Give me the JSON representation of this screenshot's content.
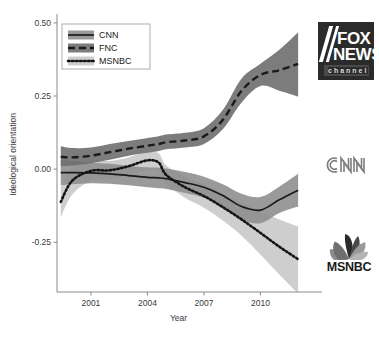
{
  "chart_data": {
    "type": "line",
    "title": "",
    "xlabel": "Year",
    "ylabel": "Ideological orientation",
    "xlim": [
      1999.2,
      2012.1
    ],
    "ylim": [
      -0.42,
      0.52
    ],
    "xticks": [
      2001,
      2004,
      2007,
      2010
    ],
    "xticklabels": [
      "2001",
      "2004",
      "2007",
      "2010"
    ],
    "yticks": [
      0.5,
      0.25,
      0.0,
      -0.25
    ],
    "yticklabels": [
      "0.50",
      "0.25",
      "0.00",
      "-0.25"
    ],
    "grid": false,
    "legend_position": "upper-left",
    "bands": "shaded 95% confidence intervals around each series",
    "x": [
      1999.4,
      2000,
      2001,
      2002,
      2003,
      2004,
      2004.6,
      2005,
      2006,
      2007,
      2008,
      2009,
      2010,
      2011,
      2012
    ],
    "series": [
      {
        "name": "CNN",
        "style": "solid",
        "color": "#1a1a1a",
        "band_color": "#8f8f8f",
        "values": [
          -0.012,
          -0.012,
          -0.013,
          -0.016,
          -0.022,
          -0.028,
          -0.03,
          -0.033,
          -0.046,
          -0.062,
          -0.09,
          -0.128,
          -0.14,
          -0.105,
          -0.072
        ],
        "band_lower": [
          -0.055,
          -0.052,
          -0.048,
          -0.05,
          -0.055,
          -0.062,
          -0.065,
          -0.068,
          -0.082,
          -0.098,
          -0.128,
          -0.172,
          -0.185,
          -0.15,
          -0.128
        ],
        "band_upper": [
          0.03,
          0.028,
          0.022,
          0.018,
          0.011,
          0.006,
          0.005,
          0.002,
          -0.01,
          -0.026,
          -0.052,
          -0.084,
          -0.095,
          -0.06,
          -0.016
        ]
      },
      {
        "name": "FNC",
        "style": "dashed",
        "color": "#1a1a1a",
        "band_color": "#6e6e6e",
        "values": [
          0.042,
          0.04,
          0.046,
          0.058,
          0.07,
          0.08,
          0.086,
          0.092,
          0.098,
          0.112,
          0.168,
          0.268,
          0.322,
          0.338,
          0.36
        ],
        "band_lower": [
          0.01,
          0.012,
          0.02,
          0.032,
          0.046,
          0.056,
          0.062,
          0.068,
          0.074,
          0.086,
          0.136,
          0.228,
          0.284,
          0.268,
          0.248
        ],
        "band_upper": [
          0.078,
          0.072,
          0.074,
          0.086,
          0.096,
          0.106,
          0.112,
          0.118,
          0.124,
          0.14,
          0.202,
          0.31,
          0.36,
          0.408,
          0.468
        ]
      },
      {
        "name": "MSNBC",
        "style": "dotted",
        "color": "#141414",
        "band_color": "#c9c9c9",
        "values": [
          -0.112,
          -0.04,
          -0.006,
          -0.004,
          0.01,
          0.03,
          0.022,
          -0.02,
          -0.062,
          -0.092,
          -0.13,
          -0.172,
          -0.218,
          -0.265,
          -0.308
        ],
        "band_lower": [
          -0.165,
          -0.088,
          -0.04,
          -0.036,
          -0.02,
          -0.002,
          -0.01,
          -0.052,
          -0.098,
          -0.132,
          -0.176,
          -0.228,
          -0.292,
          -0.36,
          -0.425
        ],
        "band_upper": [
          -0.06,
          0.006,
          0.028,
          0.028,
          0.04,
          0.06,
          0.054,
          0.012,
          -0.026,
          -0.052,
          -0.084,
          -0.116,
          -0.146,
          -0.172,
          -0.196
        ]
      }
    ],
    "legend": [
      {
        "label": "CNN",
        "style": "solid"
      },
      {
        "label": "FNC",
        "style": "dashed"
      },
      {
        "label": "MSNBC",
        "style": "dotted"
      }
    ],
    "annotations": [
      {
        "name": "fox-news-logo",
        "text_lines": [
          "FOX",
          "NEWS",
          "channel"
        ]
      },
      {
        "name": "cnn-logo",
        "text_lines": [
          "CNN"
        ]
      },
      {
        "name": "msnbc-logo",
        "text_lines": [
          "MSNBC"
        ]
      }
    ]
  },
  "colors": {
    "background": "#ffffff",
    "axis": "#8a8a8a",
    "text": "#3a3a3a",
    "fox_box": "#2b2b2b",
    "cnn_gray": "#7d7d7d",
    "msnbc_dark": "#1c1c1c"
  }
}
